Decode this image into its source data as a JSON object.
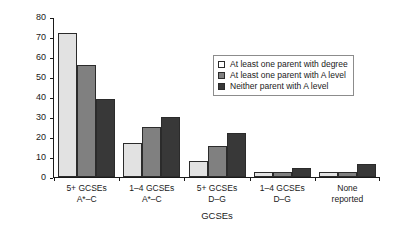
{
  "chart_data": {
    "type": "bar",
    "title": "",
    "xlabel": "GCSEs",
    "ylabel": "Percentage",
    "ylim": [
      0,
      80
    ],
    "yticks": [
      0,
      10,
      20,
      30,
      40,
      50,
      60,
      70,
      80
    ],
    "grid": false,
    "legend_position": "upper right",
    "categories": [
      "5+ GCSEs A*–C",
      "1–4 GCSEs A*–C",
      "5+ GCSEs D–G",
      "1–4 GCSEs D–G",
      "None reported"
    ],
    "category_lines": [
      {
        "line1": "5+ GCSEs",
        "line2": "A*–C"
      },
      {
        "line1": "1–4 GCSEs",
        "line2": "A*–C"
      },
      {
        "line1": "5+ GCSEs",
        "line2": "D–G"
      },
      {
        "line1": "1–4 GCSEs",
        "line2": "D–G"
      },
      {
        "line1": "None",
        "line2": "reported"
      }
    ],
    "series": [
      {
        "name": "At least one parent with degree",
        "color": "#e2e2e2",
        "values": [
          72,
          17,
          8,
          2.5,
          2.5
        ]
      },
      {
        "name": "At least one parent with A level",
        "color": "#808080",
        "values": [
          56,
          25,
          15.5,
          2.5,
          2.5
        ]
      },
      {
        "name": "Neither parent with A level",
        "color": "#383838",
        "values": [
          39,
          30,
          22,
          4.5,
          6.5
        ]
      }
    ]
  },
  "legend": {
    "items": [
      {
        "label": "At least one parent with degree"
      },
      {
        "label": "At least one parent with A level"
      },
      {
        "label": "Neither parent with A level"
      }
    ]
  }
}
